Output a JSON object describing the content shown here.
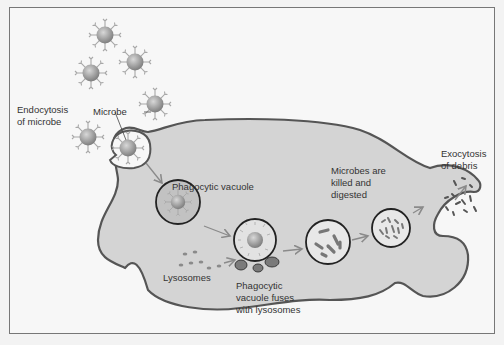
{
  "diagram": {
    "labels": {
      "endocytosis": [
        "Endocytosis",
        "of microbe"
      ],
      "microbe": "Microbe",
      "phagocytic_vacuole": "Phagocytic vacuole",
      "lysosomes": "Lysosomes",
      "fuses": [
        "Phagocytic",
        "vacuole fuses",
        "with lysosomes"
      ],
      "killed": [
        "Microbes are",
        "killed and",
        "digested"
      ],
      "exocytosis": [
        "Exocytosis",
        "of debris"
      ]
    },
    "colors": {
      "cell_fill": "#d4d4d4",
      "cell_outline": "#555555",
      "microbe": "#8f8f8f",
      "vacuole_fill": "#c2c2c2",
      "lysosome": "#7a7a7a",
      "arrow": "#8a8a8a",
      "text": "#333333"
    }
  }
}
